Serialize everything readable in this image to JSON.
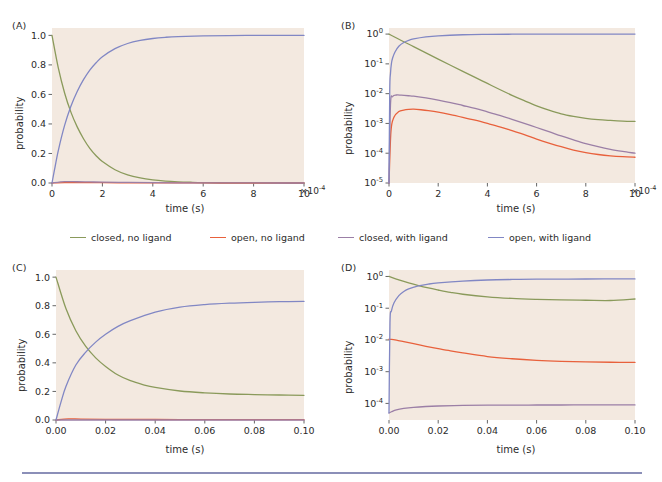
{
  "figure": {
    "background_color": "#ffffff",
    "plot_background_color": "#f3e9e0",
    "rule_color": "#8b8fb8"
  },
  "legend": {
    "position": "center, between row 1 and row 2",
    "entries": [
      {
        "label": "closed, no ligand",
        "color": "#8a9a5b",
        "key": "closed_no_ligand"
      },
      {
        "label": "open, no ligand",
        "color": "#e8613c",
        "key": "open_no_ligand"
      },
      {
        "label": "closed, with ligand",
        "color": "#9b7fa6",
        "key": "closed_with_ligand"
      },
      {
        "label": "open, with ligand",
        "color": "#8187c4",
        "key": "open_with_ligand"
      }
    ]
  },
  "chart_data": [
    {
      "panel": "(A)",
      "type": "line",
      "title": "",
      "xlabel": "time (s)",
      "ylabel": "probability",
      "xscale": "linear",
      "yscale": "linear",
      "x_multiplier": "×10",
      "x_multiplier_exponent": "-4",
      "xlim": [
        0,
        10
      ],
      "ylim": [
        0,
        1.05
      ],
      "xticks": [
        "0",
        "2",
        "4",
        "6",
        "8",
        "10"
      ],
      "xtick_values": [
        0,
        2,
        4,
        6,
        8,
        10
      ],
      "yticks": [
        "0.0",
        "0.2",
        "0.4",
        "0.6",
        "0.8",
        "1.0"
      ],
      "ytick_values": [
        0.0,
        0.2,
        0.4,
        0.6,
        0.8,
        1.0
      ],
      "grid": false,
      "series": [
        {
          "name": "closed, no ligand",
          "color": "#8a9a5b",
          "x": [
            0,
            0.25,
            0.5,
            0.75,
            1,
            1.25,
            1.5,
            1.75,
            2,
            2.5,
            3,
            3.5,
            4,
            4.5,
            5,
            5.5,
            6,
            7,
            8,
            9,
            10
          ],
          "y": [
            1.0,
            0.78,
            0.61,
            0.48,
            0.38,
            0.3,
            0.235,
            0.185,
            0.145,
            0.09,
            0.055,
            0.034,
            0.021,
            0.013,
            0.008,
            0.005,
            0.003,
            0.0012,
            0.0005,
            0.0002,
            0.0001
          ]
        },
        {
          "name": "open, no ligand",
          "color": "#e8613c",
          "x": [
            0,
            0.5,
            1,
            1.5,
            2,
            3,
            4,
            5,
            6,
            7,
            8,
            9,
            10
          ],
          "y": [
            0.0,
            0.0028,
            0.003,
            0.0026,
            0.0021,
            0.0013,
            0.0008,
            0.0004,
            0.0002,
            0.0001,
            5e-05,
            2e-05,
            1e-05
          ]
        },
        {
          "name": "closed, with ligand",
          "color": "#9b7fa6",
          "x": [
            0,
            0.5,
            1,
            1.5,
            2,
            3,
            4,
            5,
            6,
            7,
            8,
            9,
            10
          ],
          "y": [
            0.0,
            0.009,
            0.0085,
            0.0072,
            0.006,
            0.0038,
            0.0022,
            0.0012,
            0.0006,
            0.0003,
            0.00018,
            0.00012,
            0.0001
          ]
        },
        {
          "name": "open, with ligand",
          "color": "#8187c4",
          "x": [
            0,
            0.1,
            0.25,
            0.5,
            0.75,
            1,
            1.25,
            1.5,
            1.75,
            2,
            2.5,
            3,
            3.5,
            4,
            4.5,
            5,
            6,
            7,
            8,
            9,
            10
          ],
          "y": [
            0.0,
            0.09,
            0.22,
            0.39,
            0.52,
            0.62,
            0.7,
            0.765,
            0.815,
            0.855,
            0.91,
            0.945,
            0.966,
            0.979,
            0.987,
            0.992,
            0.997,
            0.999,
            0.9995,
            0.9998,
            1.0
          ]
        }
      ]
    },
    {
      "panel": "(B)",
      "type": "line",
      "title": "",
      "xlabel": "time (s)",
      "ylabel": "probability",
      "xscale": "linear",
      "yscale": "log",
      "x_multiplier": "×10",
      "x_multiplier_exponent": "-4",
      "xlim": [
        0,
        10
      ],
      "ylim": [
        1e-05,
        1.6
      ],
      "xticks": [
        "0",
        "2",
        "4",
        "6",
        "8",
        "10"
      ],
      "xtick_values": [
        0,
        2,
        4,
        6,
        8,
        10
      ],
      "yticks": [
        "10⁻⁵",
        "10⁻⁴",
        "10⁻³",
        "10⁻²",
        "10⁻¹",
        "10⁰"
      ],
      "ytick_values": [
        1e-05,
        0.0001,
        0.001,
        0.01,
        0.1,
        1
      ],
      "grid": false,
      "series": [
        {
          "name": "closed, no ligand",
          "color": "#8a9a5b",
          "x": [
            0,
            0.5,
            1,
            1.5,
            2,
            2.5,
            3,
            3.5,
            4,
            4.5,
            5,
            5.5,
            6,
            6.5,
            7,
            7.5,
            8,
            8.5,
            9,
            9.5,
            10
          ],
          "y": [
            1.0,
            0.61,
            0.38,
            0.235,
            0.145,
            0.09,
            0.056,
            0.035,
            0.022,
            0.0138,
            0.0088,
            0.0058,
            0.0039,
            0.0028,
            0.0021,
            0.00172,
            0.00148,
            0.00134,
            0.00126,
            0.0012,
            0.00117
          ]
        },
        {
          "name": "open, no ligand",
          "color": "#e8613c",
          "x": [
            0,
            0.08,
            0.2,
            0.4,
            0.6,
            0.8,
            1,
            1.3,
            1.6,
            2,
            2.5,
            3,
            3.5,
            4,
            4.5,
            5,
            5.5,
            6,
            6.5,
            7,
            7.5,
            8,
            8.5,
            9,
            9.5,
            10
          ],
          "y": [
            1e-05,
            0.00055,
            0.0016,
            0.0025,
            0.0028,
            0.00295,
            0.003,
            0.00288,
            0.0027,
            0.0024,
            0.00198,
            0.0016,
            0.00128,
            0.001,
            0.00077,
            0.00057,
            0.00042,
            0.0003,
            0.00022,
            0.000165,
            0.000128,
            0.000105,
            9.05e-05,
            8.15e-05,
            7.63e-05,
            7.33e-05
          ]
        },
        {
          "name": "closed, with ligand",
          "color": "#9b7fa6",
          "x": [
            0,
            0.06,
            0.15,
            0.3,
            0.5,
            0.8,
            1,
            1.5,
            2,
            2.5,
            3,
            3.5,
            4,
            4.5,
            5,
            5.5,
            6,
            6.5,
            7,
            7.5,
            8,
            8.5,
            9,
            9.5,
            10
          ],
          "y": [
            1e-05,
            0.0042,
            0.008,
            0.009,
            0.0089,
            0.0085,
            0.0082,
            0.0072,
            0.0061,
            0.005,
            0.004,
            0.0032,
            0.00245,
            0.00186,
            0.00138,
            0.00101,
            0.00073,
            0.00053,
            0.00038,
            0.00028,
            0.00021,
            0.000165,
            0.000135,
            0.000115,
            0.0001
          ]
        },
        {
          "name": "open, with ligand",
          "color": "#8187c4",
          "x": [
            0,
            0.03,
            0.06,
            0.1,
            0.15,
            0.25,
            0.4,
            0.6,
            0.8,
            1,
            1.5,
            2,
            3,
            4,
            5,
            6,
            7,
            8,
            9,
            10
          ],
          "y": [
            1e-05,
            0.012,
            0.048,
            0.105,
            0.16,
            0.255,
            0.39,
            0.52,
            0.615,
            0.685,
            0.8,
            0.875,
            0.95,
            0.978,
            0.99,
            0.996,
            0.998,
            0.9993,
            0.9997,
            1.0
          ]
        }
      ]
    },
    {
      "panel": "(C)",
      "type": "line",
      "title": "",
      "xlabel": "time (s)",
      "ylabel": "probability",
      "xscale": "linear",
      "yscale": "linear",
      "x_multiplier": "",
      "x_multiplier_exponent": "",
      "xlim": [
        0,
        0.1
      ],
      "ylim": [
        0,
        1.05
      ],
      "xticks": [
        "0.00",
        "0.02",
        "0.04",
        "0.06",
        "0.08",
        "0.10"
      ],
      "xtick_values": [
        0.0,
        0.02,
        0.04,
        0.06,
        0.08,
        0.1
      ],
      "yticks": [
        "0.0",
        "0.2",
        "0.4",
        "0.6",
        "0.8",
        "1.0"
      ],
      "ytick_values": [
        0.0,
        0.2,
        0.4,
        0.6,
        0.8,
        1.0
      ],
      "grid": false,
      "series": [
        {
          "name": "closed, no ligand",
          "color": "#8a9a5b",
          "x": [
            0,
            0.004,
            0.008,
            0.012,
            0.016,
            0.02,
            0.025,
            0.03,
            0.035,
            0.04,
            0.05,
            0.06,
            0.07,
            0.08,
            0.09,
            0.1
          ],
          "y": [
            1.0,
            0.78,
            0.625,
            0.515,
            0.435,
            0.375,
            0.315,
            0.275,
            0.248,
            0.228,
            0.203,
            0.19,
            0.182,
            0.178,
            0.175,
            0.173
          ]
        },
        {
          "name": "open, no ligand",
          "color": "#e8613c",
          "x": [
            0,
            0.005,
            0.01,
            0.02,
            0.04,
            0.06,
            0.08,
            0.1
          ],
          "y": [
            0.0,
            0.0075,
            0.0065,
            0.005,
            0.0034,
            0.0026,
            0.0022,
            0.002
          ]
        },
        {
          "name": "closed, with ligand",
          "color": "#9b7fa6",
          "x": [
            0,
            0.005,
            0.01,
            0.02,
            0.04,
            0.06,
            0.08,
            0.1
          ],
          "y": [
            0.0,
            7e-05,
            8e-05,
            9e-05,
            9e-05,
            9e-05,
            9e-05,
            9e-05
          ]
        },
        {
          "name": "open, with ligand",
          "color": "#8187c4",
          "x": [
            0,
            0.002,
            0.004,
            0.008,
            0.012,
            0.016,
            0.02,
            0.025,
            0.03,
            0.04,
            0.05,
            0.06,
            0.07,
            0.08,
            0.09,
            0.1
          ],
          "y": [
            0.0,
            0.125,
            0.235,
            0.385,
            0.475,
            0.545,
            0.6,
            0.655,
            0.695,
            0.755,
            0.79,
            0.808,
            0.818,
            0.824,
            0.828,
            0.83
          ]
        }
      ]
    },
    {
      "panel": "(D)",
      "type": "line",
      "title": "",
      "xlabel": "time (s)",
      "ylabel": "probability",
      "xscale": "linear",
      "yscale": "log",
      "x_multiplier": "",
      "x_multiplier_exponent": "",
      "xlim": [
        0,
        0.1
      ],
      "ylim": [
        3e-05,
        1.6
      ],
      "xticks": [
        "0.00",
        "0.02",
        "0.04",
        "0.06",
        "0.08",
        "0.10"
      ],
      "xtick_values": [
        0.0,
        0.02,
        0.04,
        0.06,
        0.08,
        0.1
      ],
      "yticks": [
        "10⁻⁴",
        "10⁻³",
        "10⁻²",
        "10⁻¹",
        "10⁰"
      ],
      "ytick_values": [
        0.0001,
        0.001,
        0.01,
        0.1,
        1
      ],
      "grid": false,
      "series": [
        {
          "name": "closed, no ligand",
          "color": "#8a9a5b",
          "x": [
            0,
            0.004,
            0.008,
            0.012,
            0.016,
            0.02,
            0.025,
            0.03,
            0.04,
            0.05,
            0.06,
            0.07,
            0.08,
            0.09,
            0.1
          ],
          "y": [
            1.0,
            0.78,
            0.625,
            0.515,
            0.435,
            0.375,
            0.315,
            0.275,
            0.228,
            0.203,
            0.19,
            0.182,
            0.178,
            0.175,
            0.195
          ]
        },
        {
          "name": "open, no ligand",
          "color": "#e8613c",
          "x": [
            0,
            0.001,
            0.003,
            0.006,
            0.01,
            0.015,
            0.02,
            0.025,
            0.03,
            0.04,
            0.05,
            0.06,
            0.07,
            0.08,
            0.09,
            0.1
          ],
          "y": [
            0.0105,
            0.0104,
            0.0098,
            0.0088,
            0.0076,
            0.0063,
            0.0053,
            0.0045,
            0.0039,
            0.003,
            0.00255,
            0.00228,
            0.00212,
            0.00203,
            0.00198,
            0.00195
          ]
        },
        {
          "name": "closed, with ligand",
          "color": "#9b7fa6",
          "x": [
            0,
            0.001,
            0.003,
            0.006,
            0.01,
            0.015,
            0.02,
            0.03,
            0.04,
            0.05,
            0.06,
            0.07,
            0.08,
            0.09,
            0.1
          ],
          "y": [
            5e-05,
            5.45e-05,
            6.25e-05,
            6.95e-05,
            7.55e-05,
            8e-05,
            8.28e-05,
            8.62e-05,
            8.78e-05,
            8.86e-05,
            8.9e-05,
            8.92e-05,
            8.93e-05,
            8.94e-05,
            8.95e-05
          ]
        },
        {
          "name": "open, with ligand",
          "color": "#8187c4",
          "x": [
            0,
            0.0004,
            0.001,
            0.002,
            0.004,
            0.006,
            0.008,
            0.012,
            0.016,
            0.02,
            0.03,
            0.04,
            0.05,
            0.06,
            0.08,
            0.1
          ],
          "y": [
            5e-05,
            0.035,
            0.082,
            0.145,
            0.248,
            0.335,
            0.408,
            0.505,
            0.575,
            0.625,
            0.715,
            0.775,
            0.805,
            0.82,
            0.832,
            0.838
          ]
        }
      ]
    }
  ]
}
